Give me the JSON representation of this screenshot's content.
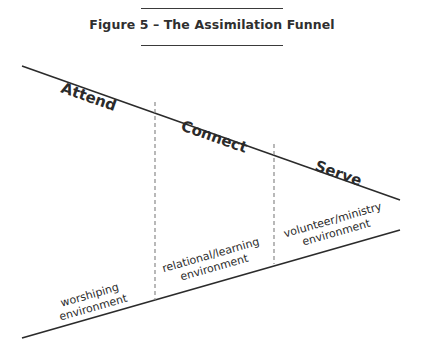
{
  "figure": {
    "title": "Figure 5 – The Assimilation Funnel"
  },
  "funnel": {
    "stages": [
      {
        "label": "Attend",
        "environment_line1": "worshiping",
        "environment_line2": "environment"
      },
      {
        "label": "Connect",
        "environment_line1": "relational/learning",
        "environment_line2": "environment"
      },
      {
        "label": "Serve",
        "environment_line1": "volunteer/ministry",
        "environment_line2": "environment"
      }
    ]
  },
  "colors": {
    "line": "#2b2b2b",
    "divider": "#8a8a8a",
    "text": "#2b2b2b"
  }
}
